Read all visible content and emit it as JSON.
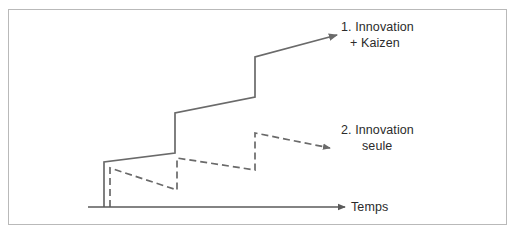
{
  "diagram": {
    "background_color": "#ffffff",
    "frame_color": "#b9b9b9",
    "line_color": "#6a6a6a",
    "axis_color": "#5a5a5a",
    "text_color": "#2b2b2b"
  },
  "labels": {
    "series1_line1": "1. Innovation",
    "series1_line2": "+ Kaizen",
    "series2_line1": "2. Innovation",
    "series2_line2": "seule",
    "axis_x": "Temps"
  },
  "chart_data": {
    "type": "line",
    "title": "",
    "xlabel": "Temps",
    "ylabel": "",
    "grid": false,
    "legend": "inline-right",
    "series": [
      {
        "name": "1. Innovation + Kaizen",
        "style": "solid",
        "color": "#6a6a6a",
        "arrow": true,
        "points": [
          [
            104,
            207
          ],
          [
            104,
            162
          ],
          [
            175,
            153
          ],
          [
            175,
            113
          ],
          [
            255,
            97
          ],
          [
            255,
            57
          ],
          [
            337,
            35
          ]
        ]
      },
      {
        "name": "2. Innovation seule",
        "style": "dashed",
        "color": "#6a6a6a",
        "dash": "7,4",
        "arrow": true,
        "points": [
          [
            110,
            207
          ],
          [
            110,
            168
          ],
          [
            177,
            190
          ],
          [
            177,
            158
          ],
          [
            255,
            170
          ],
          [
            255,
            133
          ],
          [
            330,
            148
          ]
        ]
      }
    ],
    "axes": {
      "x_axis": {
        "from": [
          88,
          207
        ],
        "to": [
          345,
          207
        ],
        "arrow": true
      }
    }
  }
}
